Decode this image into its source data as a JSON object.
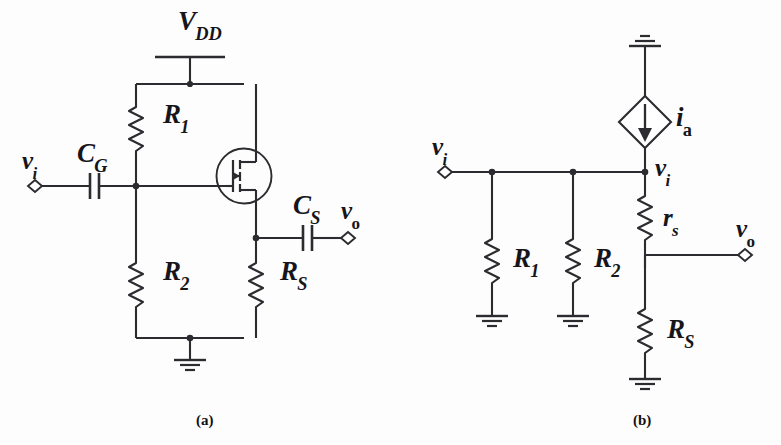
{
  "figure": {
    "background_color": "#fdfdfd",
    "line_color": "#2b2b30",
    "text_color": "#15151a",
    "width": 781,
    "height": 445
  },
  "captions": [
    {
      "id": "caption-a",
      "text": "(a)",
      "x": 196,
      "y": 412
    },
    {
      "id": "caption-b",
      "text": "(b)",
      "x": 633,
      "y": 412
    }
  ],
  "circuit_a": {
    "title": "(a)",
    "description": "Common-drain (source-follower) MOSFET amplifier with gate bias divider",
    "labels": {
      "supply": {
        "base": "V",
        "sub": "DD",
        "x": 178,
        "y": 8
      },
      "input_terminal": {
        "base": "v",
        "sub": "i",
        "x": 22,
        "y": 148
      },
      "gate_capacitor": {
        "base": "C",
        "sub": "G",
        "x": 77,
        "y": 142
      },
      "resistor_1": {
        "base": "R",
        "sub": "1",
        "x": 163,
        "y": 101
      },
      "resistor_2": {
        "base": "R",
        "sub": "2",
        "x": 163,
        "y": 257
      },
      "source_resistor": {
        "base": "R",
        "sub": "S",
        "x": 257,
        "y": 257
      },
      "source_capacitor": {
        "base": "C",
        "sub": "S",
        "x": 293,
        "y": 190
      },
      "output_terminal": {
        "base": "v",
        "sub": "o",
        "x": 341,
        "y": 190
      }
    },
    "components": [
      {
        "name": "dc-supply-vdd",
        "type": "voltage-supply-rail"
      },
      {
        "name": "resistor-r1",
        "type": "resistor"
      },
      {
        "name": "resistor-r2",
        "type": "resistor"
      },
      {
        "name": "resistor-rs",
        "type": "resistor"
      },
      {
        "name": "capacitor-cg",
        "type": "capacitor"
      },
      {
        "name": "capacitor-cs",
        "type": "capacitor"
      },
      {
        "name": "mosfet-q1",
        "type": "n-channel-mosfet-enhancement"
      },
      {
        "name": "ground-symbol",
        "type": "ground"
      },
      {
        "name": "input-terminal-vi",
        "type": "diamond-terminal"
      },
      {
        "name": "output-terminal-vo",
        "type": "diamond-terminal"
      }
    ]
  },
  "circuit_b": {
    "title": "(b)",
    "description": "Small-signal equivalent circuit with dependent current source",
    "labels": {
      "current_source": {
        "base": "i",
        "sub": "a",
        "x": 672,
        "y": 101
      },
      "input_terminal": {
        "base": "v",
        "sub": "i",
        "x": 432,
        "y": 133
      },
      "node_vi": {
        "base": "v",
        "sub": "i",
        "x": 657,
        "y": 152
      },
      "resistor_1": {
        "base": "R",
        "sub": "1",
        "x": 508,
        "y": 257
      },
      "resistor_2": {
        "base": "R",
        "sub": "2",
        "x": 590,
        "y": 257
      },
      "small_signal_rs": {
        "base": "r",
        "sub": "s",
        "x": 661,
        "y": 208
      },
      "source_resistor": {
        "base": "R",
        "sub": "S",
        "x": 672,
        "y": 308
      },
      "output_terminal": {
        "base": "v",
        "sub": "o",
        "x": 738,
        "y": 208
      }
    },
    "components": [
      {
        "name": "current-source-ia",
        "type": "dependent-current-source-diamond"
      },
      {
        "name": "resistor-r1",
        "type": "resistor"
      },
      {
        "name": "resistor-r2",
        "type": "resistor"
      },
      {
        "name": "resistor-rs-small",
        "type": "resistor"
      },
      {
        "name": "resistor-rs-big",
        "type": "resistor"
      },
      {
        "name": "ground-top",
        "type": "ground"
      },
      {
        "name": "ground-r1",
        "type": "ground"
      },
      {
        "name": "ground-r2",
        "type": "ground"
      },
      {
        "name": "ground-bottom",
        "type": "ground"
      },
      {
        "name": "input-terminal-vi",
        "type": "diamond-terminal"
      },
      {
        "name": "output-terminal-vo",
        "type": "diamond-terminal"
      }
    ]
  }
}
